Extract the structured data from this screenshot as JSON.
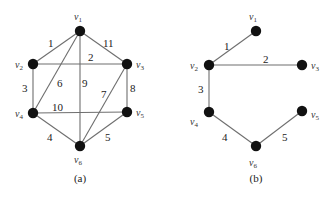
{
  "figures": [
    {
      "id": "a",
      "caption": "(a)",
      "caption_pos": [
        80,
        182
      ],
      "nodes": [
        {
          "id": "v1",
          "label": "v",
          "sub": "1",
          "x": 80,
          "y": 31,
          "lx": 74,
          "ly": 20
        },
        {
          "id": "v2",
          "label": "v",
          "sub": "2",
          "x": 33,
          "y": 64,
          "lx": 15,
          "ly": 68
        },
        {
          "id": "v3",
          "label": "v",
          "sub": "3",
          "x": 127,
          "y": 64,
          "lx": 136,
          "ly": 68
        },
        {
          "id": "v4",
          "label": "v",
          "sub": "4",
          "x": 33,
          "y": 113,
          "lx": 15,
          "ly": 117
        },
        {
          "id": "v5",
          "label": "v",
          "sub": "5",
          "x": 127,
          "y": 112,
          "lx": 136,
          "ly": 116
        },
        {
          "id": "v6",
          "label": "v",
          "sub": "6",
          "x": 80,
          "y": 146,
          "lx": 74,
          "ly": 163
        }
      ],
      "edges": [
        {
          "from": "v1",
          "to": "v2",
          "weight": "1",
          "wx": 48,
          "wy": 47
        },
        {
          "from": "v2",
          "to": "v3",
          "weight": "2",
          "wx": 88,
          "wy": 61
        },
        {
          "from": "v2",
          "to": "v4",
          "weight": "3",
          "wx": 22,
          "wy": 92
        },
        {
          "from": "v4",
          "to": "v6",
          "weight": "4",
          "wx": 47,
          "wy": 141
        },
        {
          "from": "v5",
          "to": "v6",
          "weight": "5",
          "wx": 105,
          "wy": 141
        },
        {
          "from": "v1",
          "to": "v4",
          "weight": "6",
          "wx": 57,
          "wy": 87
        },
        {
          "from": "v3",
          "to": "v6",
          "weight": "7",
          "wx": 101,
          "wy": 98
        },
        {
          "from": "v3",
          "to": "v5",
          "weight": "8",
          "wx": 130,
          "wy": 92
        },
        {
          "from": "v1",
          "to": "v6",
          "weight": "9",
          "wx": 82,
          "wy": 87
        },
        {
          "from": "v4",
          "to": "v5",
          "weight": "10",
          "wx": 52,
          "wy": 111
        },
        {
          "from": "v1",
          "to": "v3",
          "weight": "11",
          "wx": 103,
          "wy": 47
        }
      ]
    },
    {
      "id": "b",
      "caption": "(b)",
      "caption_pos": [
        256,
        182
      ],
      "nodes": [
        {
          "id": "v1",
          "label": "v",
          "sub": "1",
          "x": 256,
          "y": 31,
          "lx": 249,
          "ly": 20
        },
        {
          "id": "v2",
          "label": "v",
          "sub": "2",
          "x": 209,
          "y": 65,
          "lx": 190,
          "ly": 69
        },
        {
          "id": "v3",
          "label": "v",
          "sub": "3",
          "x": 302,
          "y": 65,
          "lx": 311,
          "ly": 69
        },
        {
          "id": "v4",
          "label": "v",
          "sub": "4",
          "x": 209,
          "y": 112,
          "lx": 190,
          "ly": 125
        },
        {
          "id": "v5",
          "label": "v",
          "sub": "5",
          "x": 302,
          "y": 111,
          "lx": 311,
          "ly": 118
        },
        {
          "id": "v6",
          "label": "v",
          "sub": "6",
          "x": 256,
          "y": 146,
          "lx": 249,
          "ly": 166
        }
      ],
      "edges": [
        {
          "from": "v1",
          "to": "v2",
          "weight": "1",
          "wx": 224,
          "wy": 50
        },
        {
          "from": "v2",
          "to": "v3",
          "weight": "2",
          "wx": 263,
          "wy": 63
        },
        {
          "from": "v2",
          "to": "v4",
          "weight": "3",
          "wx": 198,
          "wy": 93
        },
        {
          "from": "v4",
          "to": "v6",
          "weight": "4",
          "wx": 222,
          "wy": 141
        },
        {
          "from": "v6",
          "to": "v5",
          "weight": "5",
          "wx": 282,
          "wy": 141
        }
      ]
    }
  ]
}
